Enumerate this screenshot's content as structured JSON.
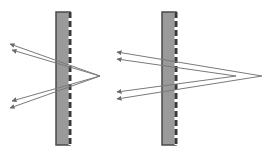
{
  "figure": {
    "colors": {
      "background": "#ffffff",
      "slab_fill": "#9a9a9a",
      "slab_edge": "#4a4a4a",
      "dashed_edge": "#3a3a3a",
      "ray": "#7a7a7a",
      "arrowhead": "#6a6a6a"
    }
  },
  "panels": [
    {
      "id": "left",
      "slab": {
        "x": 56,
        "y": 12,
        "width": 14,
        "height": 133
      },
      "apex": {
        "x": 100,
        "y": 76
      },
      "rays": [
        {
          "from": [
            100,
            76
          ],
          "to": [
            10,
            44
          ]
        },
        {
          "from": [
            100,
            76
          ],
          "to": [
            12,
            50
          ]
        },
        {
          "from": [
            100,
            76
          ],
          "to": [
            12,
            101
          ]
        },
        {
          "from": [
            100,
            76
          ],
          "to": [
            10,
            108
          ]
        }
      ]
    },
    {
      "id": "right",
      "slab": {
        "x": 162,
        "y": 12,
        "width": 14,
        "height": 133
      },
      "apex": {
        "x": 262,
        "y": 76
      },
      "rays": [
        {
          "from": [
            262,
            76
          ],
          "to": [
            117,
            52
          ]
        },
        {
          "from": [
            236,
            76
          ],
          "to": [
            117,
            59
          ]
        },
        {
          "from": [
            236,
            76
          ],
          "to": [
            117,
            92
          ]
        },
        {
          "from": [
            262,
            76
          ],
          "to": [
            117,
            99
          ]
        }
      ]
    }
  ]
}
